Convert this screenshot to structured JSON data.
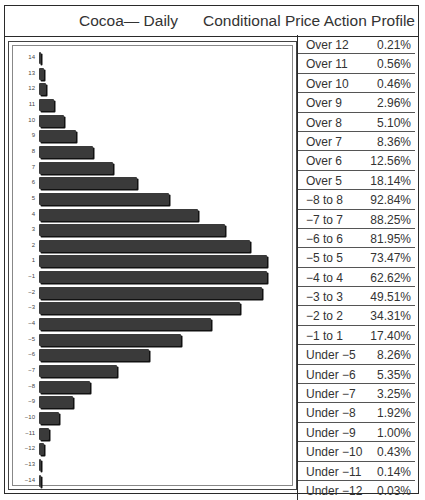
{
  "header": {
    "title_left": "Cocoa— Daily",
    "title_right": "Conditional Price Action Profile"
  },
  "chart_data": {
    "type": "bar",
    "orientation": "horizontal",
    "title": "Cocoa— Daily  Conditional Price Action Profile",
    "xlabel": "",
    "ylabel": "",
    "grid": false,
    "legend": "none",
    "categories": [
      "14",
      "13",
      "12",
      "11",
      "10",
      "9",
      "8",
      "7",
      "6",
      "5",
      "4",
      "3",
      "2",
      "1",
      "−1",
      "−2",
      "−3",
      "−4",
      "−5",
      "−6",
      "−7",
      "−8",
      "−9",
      "−10",
      "−11",
      "−12",
      "−13",
      "−14"
    ],
    "values": [
      1,
      2,
      3,
      6,
      10,
      15,
      22,
      30,
      40,
      53,
      65,
      76,
      86,
      93,
      93,
      91,
      82,
      70,
      58,
      45,
      32,
      21,
      14,
      8,
      4,
      2,
      1,
      0.5
    ],
    "value_units": "relative bar length (estimated, max ≈ 100)",
    "table": [
      {
        "label": "Over 12",
        "value": "0.21%"
      },
      {
        "label": "Over 11",
        "value": "0.56%"
      },
      {
        "label": "Over 10",
        "value": "0.46%"
      },
      {
        "label": "Over 9",
        "value": "2.96%"
      },
      {
        "label": "Over 8",
        "value": "5.10%"
      },
      {
        "label": "Over 7",
        "value": "8.36%"
      },
      {
        "label": "Over 6",
        "value": "12.56%"
      },
      {
        "label": "Over 5",
        "value": "18.14%"
      },
      {
        "label": "−8 to 8",
        "value": "92.84%"
      },
      {
        "label": "−7 to 7",
        "value": "88.25%"
      },
      {
        "label": "−6 to 6",
        "value": "81.95%"
      },
      {
        "label": "−5 to 5",
        "value": "73.47%"
      },
      {
        "label": "−4 to 4",
        "value": "62.62%"
      },
      {
        "label": "−3 to 3",
        "value": "49.51%"
      },
      {
        "label": "−2 to 2",
        "value": "34.31%"
      },
      {
        "label": "−1 to 1",
        "value": "17.40%"
      },
      {
        "label": "Under −5",
        "value": "8.26%"
      },
      {
        "label": "Under −6",
        "value": "5.35%"
      },
      {
        "label": "Under −7",
        "value": "3.25%"
      },
      {
        "label": "Under −8",
        "value": "1.92%"
      },
      {
        "label": "Under −9",
        "value": "1.00%"
      },
      {
        "label": "Under −10",
        "value": "0.43%"
      },
      {
        "label": "Under −11",
        "value": "0.14%"
      },
      {
        "label": "Under −12",
        "value": "0.03%"
      }
    ]
  },
  "colors": {
    "bar": "#3a3a3a",
    "bar_shadow": "#111111",
    "border": "#2a2a2a",
    "background": "#ffffff"
  }
}
